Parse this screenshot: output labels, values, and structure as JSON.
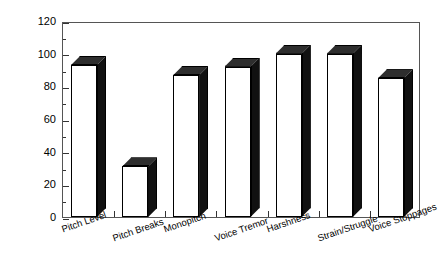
{
  "chart_data": {
    "type": "bar",
    "title": "",
    "subtitle": "",
    "xlabel": "",
    "ylabel": "Percent of Patients",
    "categories": [
      "Pitch Level",
      "Pitch Breaks",
      "Monopitch",
      "Voice Tremor",
      "Harshness",
      "Strain/Struggle",
      "Voice Stoppages"
    ],
    "values": [
      93,
      31,
      87,
      92,
      100,
      100,
      85
    ],
    "ylim": [
      0,
      120
    ],
    "ytick_labels": [
      "0",
      "20",
      "40",
      "60",
      "80",
      "100",
      "120"
    ],
    "ytick_values": [
      0,
      20,
      40,
      60,
      80,
      100,
      120
    ],
    "y_minor_interval": 10,
    "grid": false,
    "legend": null,
    "legend_position": "none",
    "bar_style": "3d-block",
    "bar_face_color": "#ffffff",
    "bar_side_color": "#111111",
    "bar_top_color": "#2e2e2e",
    "bar_edge_color": "#000000",
    "frame_color": "#555555",
    "background_color": "#ffffff",
    "text_color": "#000000"
  }
}
